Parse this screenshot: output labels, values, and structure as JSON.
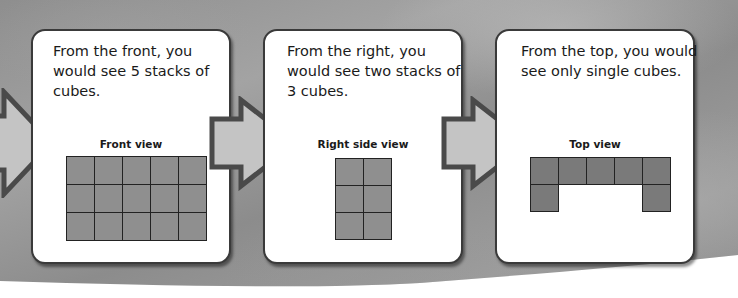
{
  "panels": [
    {
      "text": "From the front, you would see 5 stacks of cubes.",
      "view_label": "Front view",
      "grid": {
        "rows": 3,
        "cols": 5,
        "cells": [
          1,
          1,
          1,
          1,
          1,
          1,
          1,
          1,
          1,
          1,
          1,
          1,
          1,
          1,
          1
        ]
      }
    },
    {
      "text": "From the right, you would see two stacks of 3 cubes.",
      "view_label": "Right side view",
      "grid": {
        "rows": 3,
        "cols": 2,
        "cells": [
          1,
          1,
          1,
          1,
          1,
          1
        ]
      }
    },
    {
      "text": "From the top, you would see only single cubes.",
      "view_label": "Top view",
      "grid": {
        "rows": 2,
        "cols": 5,
        "cells": [
          1,
          1,
          1,
          1,
          1,
          1,
          0,
          0,
          0,
          1
        ]
      }
    }
  ],
  "colors": {
    "cube_fill": "#8f8f8f",
    "cube_fill_top": "#7a7a7a",
    "arrow_fill": "#c4c4c4",
    "arrow_stroke": "#4a4a4a",
    "panel_border": "#3a3a3a"
  }
}
